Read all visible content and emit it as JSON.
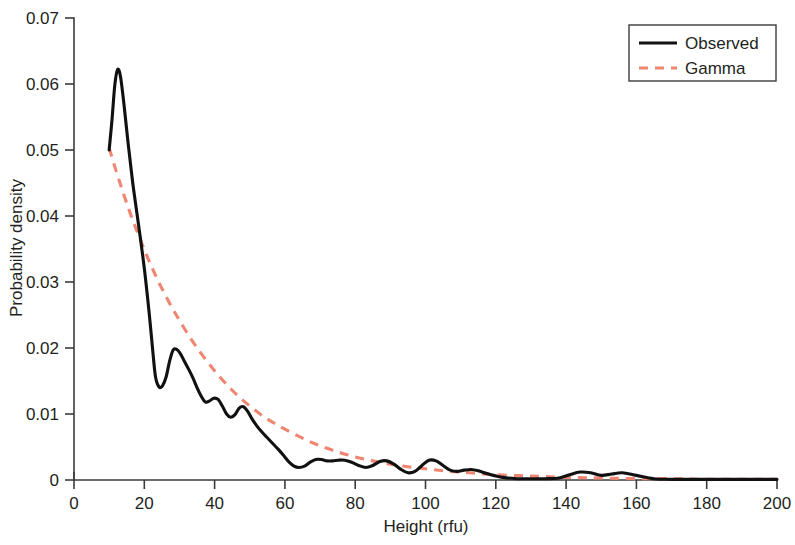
{
  "chart_data": {
    "type": "line",
    "title": "",
    "xlabel": "Height (rfu)",
    "ylabel": "Probability density",
    "xlim": [
      0,
      200
    ],
    "ylim": [
      0,
      0.07
    ],
    "xticks": [
      0,
      20,
      40,
      60,
      80,
      100,
      120,
      140,
      160,
      180,
      200
    ],
    "xticklabels": [
      "0",
      "20",
      "40",
      "60",
      "80",
      "100",
      "120",
      "140",
      "160",
      "180",
      "200"
    ],
    "yticks": [
      0,
      0.01,
      0.02,
      0.03,
      0.04,
      0.05,
      0.06,
      0.07
    ],
    "yticklabels": [
      "0",
      "0.01",
      "0.02",
      "0.03",
      "0.04",
      "0.05",
      "0.06",
      "0.07"
    ],
    "grid": false,
    "legend_position": "top-right",
    "series": [
      {
        "name": "Observed",
        "style": "solid",
        "color": "#111111",
        "x": [
          10.0,
          10.8,
          11.6,
          12.4,
          13.2,
          14.2,
          15.4,
          16.6,
          17.8,
          19.0,
          20.2,
          21.4,
          22.4,
          23.2,
          24.2,
          25.2,
          26.2,
          27.2,
          28.2,
          29.2,
          30.2,
          31.4,
          32.6,
          33.8,
          35.0,
          36.2,
          37.4,
          38.6,
          39.8,
          41.0,
          42.2,
          43.4,
          44.6,
          45.8,
          47.0,
          48.2,
          49.4,
          50.6,
          52.0,
          53.4,
          55.0,
          56.6,
          58.2,
          59.8,
          61.2,
          62.6,
          64.0,
          65.6,
          67.2,
          68.8,
          70.4,
          72.0,
          73.6,
          75.2,
          77.0,
          79.0,
          81.0,
          83.0,
          85.0,
          87.0,
          89.0,
          91.0,
          93.0,
          95.0,
          97.0,
          99.0,
          101.0,
          103.0,
          105.0,
          107.0,
          109.0,
          111.0,
          113.0,
          115.0,
          118.0,
          122.0,
          126.0,
          130.0,
          134.0,
          138.0,
          141.0,
          144.0,
          147.0,
          150.0,
          153.0,
          156.0,
          160.0,
          165.0,
          170.0,
          176.0,
          182.0,
          188.0,
          194.0,
          200.0
        ],
        "y": [
          0.05,
          0.0545,
          0.0598,
          0.0622,
          0.0612,
          0.057,
          0.051,
          0.0455,
          0.0408,
          0.0362,
          0.0312,
          0.0252,
          0.0196,
          0.0156,
          0.0141,
          0.0143,
          0.0156,
          0.018,
          0.0197,
          0.0198,
          0.0192,
          0.018,
          0.0168,
          0.0155,
          0.014,
          0.0127,
          0.0118,
          0.012,
          0.0124,
          0.0122,
          0.0112,
          0.01,
          0.0095,
          0.0099,
          0.0109,
          0.0111,
          0.0104,
          0.0093,
          0.0082,
          0.0073,
          0.0064,
          0.0055,
          0.0046,
          0.0036,
          0.0027,
          0.0021,
          0.0019,
          0.0021,
          0.0027,
          0.0031,
          0.0031,
          0.0029,
          0.0029,
          0.003,
          0.003,
          0.0027,
          0.0022,
          0.0019,
          0.0022,
          0.0028,
          0.0029,
          0.0024,
          0.0016,
          0.0011,
          0.0013,
          0.0022,
          0.003,
          0.0029,
          0.0022,
          0.0015,
          0.0013,
          0.0015,
          0.0016,
          0.0014,
          0.0009,
          0.0004,
          0.0002,
          0.0002,
          0.0002,
          0.0003,
          0.0008,
          0.0012,
          0.0011,
          0.0007,
          0.0009,
          0.0011,
          0.0007,
          0.0002,
          0.0001,
          0.0001,
          0.0001,
          0.0001,
          0.0001,
          0.0001
        ]
      },
      {
        "name": "Gamma",
        "style": "dashed",
        "color": "#F08572",
        "x": [
          10.0,
          12.0,
          14.0,
          16.0,
          18.0,
          20.0,
          22.0,
          24.0,
          26.0,
          28.0,
          30.0,
          33.0,
          36.0,
          39.0,
          42.0,
          45.0,
          48.0,
          51.0,
          54.0,
          57.0,
          60.0,
          64.0,
          68.0,
          72.0,
          76.0,
          80.0,
          85.0,
          90.0,
          95.0,
          100.0,
          105.0,
          110.0,
          115.0,
          120.0,
          130.0,
          140.0,
          150.0,
          160.0,
          170.0,
          180.0,
          190.0,
          200.0
        ],
        "y": [
          0.0503,
          0.0468,
          0.0435,
          0.0404,
          0.0376,
          0.0349,
          0.0324,
          0.0301,
          0.028,
          0.026,
          0.0242,
          0.0216,
          0.0193,
          0.0172,
          0.0153,
          0.0136,
          0.0121,
          0.0108,
          0.0096,
          0.0086,
          0.0077,
          0.0066,
          0.0056,
          0.0048,
          0.0041,
          0.0035,
          0.0029,
          0.0024,
          0.002,
          0.0017,
          0.0014,
          0.0012,
          0.001,
          0.0008,
          0.0006,
          0.0004,
          0.0003,
          0.0002,
          0.0002,
          0.0001,
          0.0001,
          0.0001
        ]
      }
    ],
    "legend": [
      {
        "label": "Observed",
        "style": "solid",
        "color": "#111111"
      },
      {
        "label": "Gamma",
        "style": "dashed",
        "color": "#F08572"
      }
    ]
  }
}
